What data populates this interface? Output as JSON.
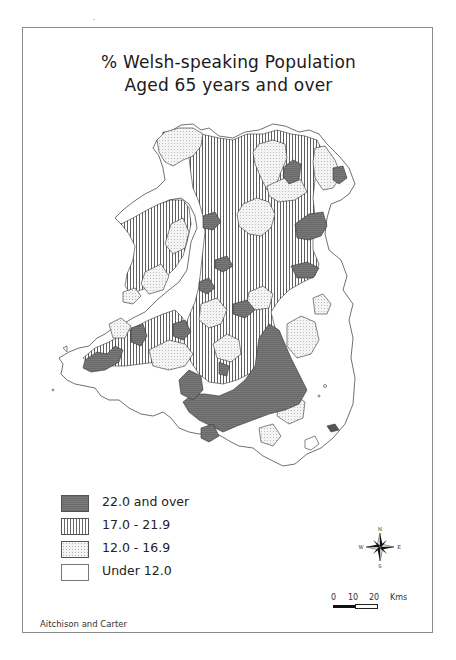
{
  "map": {
    "title_line1": "% Welsh-speaking Population",
    "title_line2": "Aged 65 years and over",
    "region": "Wales",
    "legend": [
      {
        "label": "22.0 and over",
        "pattern": "dark-grey-solid",
        "color": "#707070"
      },
      {
        "label": "17.0 - 21.9",
        "pattern": "vertical-hatch",
        "color": "#6a6a6a"
      },
      {
        "label": "12.0 - 16.9",
        "pattern": "fine-dots",
        "color": "#b5b5b5"
      },
      {
        "label": "Under 12.0",
        "pattern": "blank",
        "color": "#ffffff"
      }
    ],
    "compass": {
      "n": "N",
      "s": "S",
      "e": "E",
      "w": "W"
    },
    "scale": {
      "ticks": [
        "0",
        "10",
        "20"
      ],
      "unit": "Kms"
    },
    "credit": "Aitchison and Carter"
  }
}
